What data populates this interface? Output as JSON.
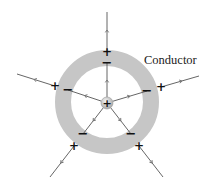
{
  "diagram": {
    "label": "Conductor",
    "colors": {
      "ring": "#c6c6c6",
      "line": "#555555",
      "arrow": "#777777",
      "sign": "#111111",
      "sphere": "#bdbdbd"
    },
    "geometry": {
      "center": [
        107,
        103
      ],
      "ring_outer_radius": 52,
      "ring_inner_radius": 36,
      "sphere_radius": 6
    },
    "central_charge": {
      "sign": "+"
    },
    "field_lines": [
      {
        "id": "top",
        "outer_end": [
          107,
          12
        ],
        "plus_at": [
          107,
          52
        ],
        "minus_at": [
          107,
          63
        ]
      },
      {
        "id": "left",
        "outer_end": [
          17,
          74
        ],
        "plus_at": [
          55,
          86
        ],
        "minus_at": [
          68,
          90
        ]
      },
      {
        "id": "right",
        "outer_end": [
          199,
          76
        ],
        "plus_at": [
          161,
          87
        ],
        "minus_at": [
          147,
          91
        ]
      },
      {
        "id": "lower-left",
        "outer_end": [
          50,
          177
        ],
        "plus_at": [
          74,
          146
        ],
        "minus_at": [
          83,
          134
        ]
      },
      {
        "id": "lower-right",
        "outer_end": [
          163,
          177
        ],
        "plus_at": [
          139,
          146
        ],
        "minus_at": [
          131,
          134
        ]
      }
    ],
    "signs": {
      "plus": "+",
      "minus": "−"
    }
  }
}
